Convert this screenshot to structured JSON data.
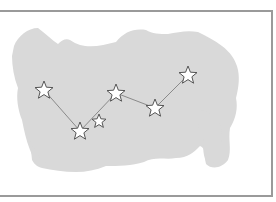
{
  "illustration": {
    "subject": "constellation",
    "background_color": "#ffffff",
    "blob_color": "#d9d9d9",
    "frame_color": "#9a9a9a",
    "line_color": "#8a8a8a",
    "star_stroke": "#555555",
    "star_fill": "#ffffff",
    "stars": [
      {
        "x": 44,
        "y": 90,
        "r": 9
      },
      {
        "x": 80,
        "y": 131,
        "r": 9
      },
      {
        "x": 99,
        "y": 121,
        "r": 7
      },
      {
        "x": 116,
        "y": 93,
        "r": 9
      },
      {
        "x": 155,
        "y": 108,
        "r": 9
      },
      {
        "x": 188,
        "y": 75,
        "r": 9
      }
    ],
    "connections": [
      [
        0,
        1
      ],
      [
        1,
        3
      ],
      [
        3,
        4
      ],
      [
        4,
        5
      ]
    ]
  }
}
